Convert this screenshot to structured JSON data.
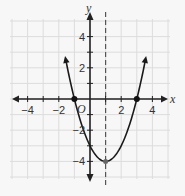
{
  "chart_data": {
    "type": "line",
    "title": "",
    "xlabel": "x",
    "ylabel": "y",
    "origin_label": "O",
    "xlim": [
      -5,
      5
    ],
    "ylim": [
      -5,
      5
    ],
    "grid": true,
    "x_ticks": [
      -4,
      -2,
      2,
      4
    ],
    "y_ticks": [
      4,
      2,
      -2,
      -4
    ],
    "x_tick_labels": [
      "−4",
      "−2",
      "2",
      "4"
    ],
    "y_tick_labels": [
      "4",
      "2",
      "−2",
      "−4"
    ],
    "series": [
      {
        "name": "parabola",
        "equation": "y = x^2 - 2x - 3",
        "x": [
          -1.5,
          -1,
          0,
          1,
          2,
          3,
          3.5
        ],
        "y": [
          2.25,
          0,
          -3,
          -4,
          -3,
          0,
          2.25
        ]
      }
    ],
    "marked_points": [
      {
        "x": -1,
        "y": 0,
        "label": "x-intercept"
      },
      {
        "x": 3,
        "y": 0,
        "label": "x-intercept"
      },
      {
        "x": 1,
        "y": -4,
        "label": "vertex"
      }
    ],
    "axis_of_symmetry": {
      "x": 1,
      "style": "dashed"
    }
  }
}
